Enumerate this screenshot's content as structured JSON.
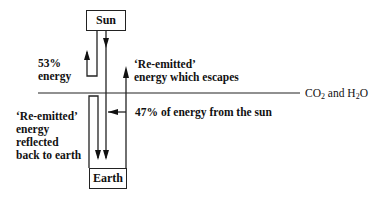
{
  "diagram": {
    "nodes": {
      "sun": "Sun",
      "earth": "Earth"
    },
    "labels": {
      "reflected_percent": "53%",
      "reflected_word": "energy",
      "escapes_line1": "‘Re-emitted’",
      "escapes_line2": "energy which escapes",
      "absorbed": "47% of energy from the sun",
      "reemitted_line1": "‘Re-emitted’",
      "reemitted_line2": "energy",
      "reemitted_line3": "reflected",
      "reemitted_line4": "back to earth",
      "layer_co": "CO",
      "layer_co_sub": "2",
      "layer_and": " and H",
      "layer_h_sub": "2",
      "layer_o": "O"
    },
    "edges": [
      {
        "from": "Sun",
        "to": "Earth",
        "label": "47% of energy from the sun"
      },
      {
        "from": "Sun",
        "to": "space",
        "label": "53% energy"
      },
      {
        "from": "Earth",
        "to": "space",
        "label": "'Re-emitted' energy which escapes"
      },
      {
        "from": "atmosphere",
        "to": "Earth",
        "label": "'Re-emitted' energy reflected back to earth"
      }
    ]
  }
}
